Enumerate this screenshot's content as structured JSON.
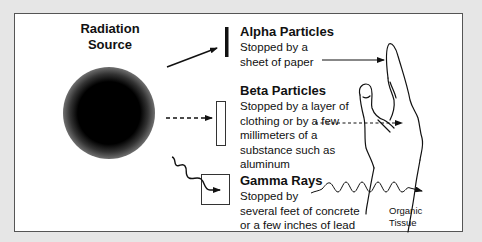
{
  "diagram": {
    "source": {
      "title_line1": "Radiation",
      "title_line2": "Source"
    },
    "alpha": {
      "title": "Alpha Particles",
      "lines": [
        "Stopped by a",
        "sheet of paper"
      ],
      "barrier": "thin-bar"
    },
    "beta": {
      "title": "Beta Particles",
      "lines": [
        "Stopped by a layer of",
        "clothing or by a few",
        "millimeters of a",
        "substance such as",
        "aluminum"
      ],
      "barrier": "thin-rectangle"
    },
    "gamma": {
      "title": "Gamma Rays",
      "lines": [
        "Stopped by",
        "several feet of concrete",
        "or a few inches of lead"
      ],
      "barrier": "square-box"
    },
    "tissue": {
      "line1": "Organic",
      "line2": "Tissue"
    },
    "icons": [
      "radiation-source-sphere",
      "solid-arrow",
      "dashed-arrow",
      "wavy-arrow",
      "hand-outline"
    ],
    "colors": {
      "background": "#e6e6e6",
      "panel": "#ffffff",
      "ink": "#111111",
      "border": "#555555"
    }
  }
}
